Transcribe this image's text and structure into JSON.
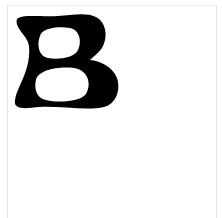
{
  "image": {
    "glyph_character": "B",
    "glyph_color": "#000000",
    "background_color": "#ffffff",
    "frame_color": "#e4e4e4"
  }
}
